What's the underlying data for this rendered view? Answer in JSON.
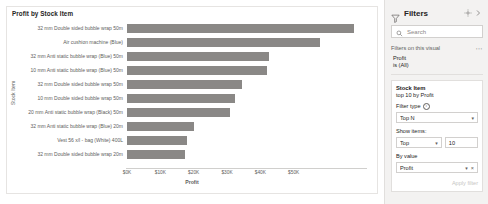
{
  "visual": {
    "title": "Profit by Stock Item",
    "yaxis_title": "Stock Item",
    "xaxis_title": "Profit"
  },
  "chart_data": {
    "type": "bar",
    "orientation": "horizontal",
    "title": "Profit by Stock Item",
    "xlabel": "Profit",
    "ylabel": "Stock Item",
    "xlim": [
      0,
      72000
    ],
    "grid": false,
    "legend": "none",
    "bar_color": "#8a8886",
    "tick_labels": [
      "$0K",
      "$10K",
      "$20K",
      "$30K",
      "$40K",
      "$50K"
    ],
    "tick_values": [
      0,
      10000,
      20000,
      30000,
      40000,
      50000
    ],
    "categories": [
      "32 mm Double sided bubble wrap 50m",
      "Air cushion machine (Blue)",
      "32 mm Anti static bubble wrap (Blue) 50m",
      "10 mm Anti static bubble wrap (Blue) 50m",
      "32 mm Double sided bubble wrap 50m",
      "10 mm Double sided bubble wrap 50m",
      "20 mm Anti static bubble wrap (Black) 50m",
      "32 mm Anti static bubble wrap (Blue) 20m",
      "Vest 56 x/l - bag (White) 400L",
      "32 mm Double sided bubble wrap 20m"
    ],
    "values": [
      68000,
      58000,
      42500,
      42000,
      34500,
      32500,
      31000,
      20000,
      18000,
      17500
    ]
  },
  "filters_pane": {
    "title": "Filters",
    "funnel_icon": "filter-funnel-icon",
    "pin_icon": "pin-icon",
    "collapse_icon": "chevron-right-icon",
    "search": {
      "placeholder": "Search",
      "icon": "search-icon"
    },
    "section_label": "Filters on this visual",
    "more_menu": "⋯",
    "basic_filter": {
      "field": "Profit",
      "value": "is (All)"
    },
    "active_filter": {
      "field": "Stock Item",
      "summary": "top 10 by Profit",
      "filter_type_label": "Filter type",
      "filter_type_value": "Top N",
      "show_items_label": "Show items:",
      "show_items_direction": "Top",
      "show_items_count": "10",
      "by_value_label": "By value",
      "by_value_field": "Profit",
      "clear_icon": "×",
      "apply_label": "Apply filter"
    }
  }
}
